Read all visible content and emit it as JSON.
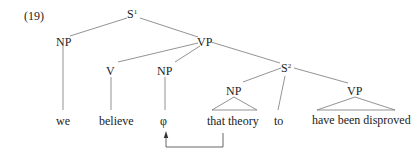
{
  "example_number": "(19)",
  "nodes": {
    "s1": {
      "label": "S",
      "sup": "1"
    },
    "np_subject": {
      "label": "NP"
    },
    "vp_main": {
      "label": "VP"
    },
    "v": {
      "label": "V"
    },
    "np_empty": {
      "label": "NP"
    },
    "s2": {
      "label": "S",
      "sup": "2"
    },
    "np_theory": {
      "label": "NP"
    },
    "vp_embedded": {
      "label": "VP"
    }
  },
  "leaves": {
    "we": "we",
    "believe": "believe",
    "phi": "φ",
    "that_theory": "that theory",
    "to": "to",
    "have_been_disproved": "have been disproved"
  },
  "movement_arrow": {
    "from": "that theory",
    "to": "φ"
  }
}
